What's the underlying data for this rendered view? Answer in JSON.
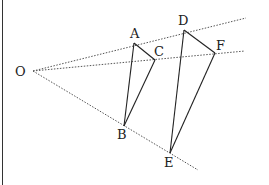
{
  "diagram": {
    "type": "geometry",
    "points": {
      "O": {
        "label": "O",
        "x": 33,
        "y": 71,
        "lx": 15,
        "ly": 76
      },
      "A": {
        "label": "A",
        "x": 134,
        "y": 43,
        "lx": 130,
        "ly": 38
      },
      "C": {
        "label": "C",
        "x": 155,
        "y": 60,
        "lx": 154,
        "ly": 56
      },
      "D": {
        "label": "D",
        "x": 184,
        "y": 30,
        "lx": 178,
        "ly": 25
      },
      "F": {
        "label": "F",
        "x": 215,
        "y": 53,
        "lx": 216,
        "ly": 50
      },
      "B": {
        "label": "B",
        "x": 124,
        "y": 126,
        "lx": 117,
        "ly": 139
      },
      "E": {
        "label": "E",
        "x": 170,
        "y": 153,
        "lx": 164,
        "ly": 167
      }
    },
    "rays": [
      {
        "from": "O",
        "to_x": 246,
        "to_y": 18,
        "style": "dotted"
      },
      {
        "from": "O",
        "to_x": 245,
        "to_y": 51,
        "style": "dotted"
      },
      {
        "from": "O",
        "to_x": 198,
        "to_y": 170,
        "style": "dotted"
      }
    ],
    "segments": [
      [
        "A",
        "C"
      ],
      [
        "A",
        "B"
      ],
      [
        "C",
        "B"
      ],
      [
        "D",
        "F"
      ],
      [
        "D",
        "E"
      ],
      [
        "F",
        "E"
      ]
    ],
    "colors": {
      "line": "#222222",
      "ray": "#555555"
    }
  }
}
